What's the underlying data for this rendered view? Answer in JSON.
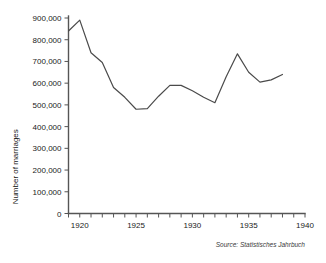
{
  "figure": {
    "background_color": "#ffffff",
    "axis_color": "#555555",
    "line_color": "#4a4a4a",
    "source_note": "Source:  Statistisches Jahrbuch"
  },
  "chart_data": {
    "type": "line",
    "title": "",
    "xlabel": "",
    "ylabel": "Number of marriages",
    "xlim": [
      1919,
      1940
    ],
    "ylim": [
      0,
      900000
    ],
    "grid": false,
    "legend": "none",
    "x": [
      1919,
      1920,
      1921,
      1922,
      1923,
      1924,
      1925,
      1926,
      1927,
      1928,
      1929,
      1930,
      1931,
      1932,
      1933,
      1934,
      1935,
      1936,
      1937,
      1938
    ],
    "values": [
      840000,
      890000,
      740000,
      695000,
      580000,
      535000,
      480000,
      483000,
      540000,
      590000,
      590000,
      565000,
      535000,
      510000,
      630000,
      735000,
      650000,
      605000,
      615000,
      640000
    ],
    "series": [
      {
        "name": "Number of marriages",
        "values": [
          840000,
          890000,
          740000,
          695000,
          580000,
          535000,
          480000,
          483000,
          540000,
          590000,
          590000,
          565000,
          535000,
          510000,
          630000,
          735000,
          650000,
          605000,
          615000,
          640000
        ]
      }
    ],
    "y_ticks": [
      0,
      100000,
      200000,
      300000,
      400000,
      500000,
      600000,
      700000,
      800000,
      900000
    ],
    "y_tick_labels": [
      "0",
      "100,000",
      "200,000",
      "300,000",
      "400,000",
      "500,000",
      "600,000",
      "700,000",
      "800,000",
      "900,000"
    ],
    "x_ticks": [
      1919,
      1920,
      1921,
      1922,
      1923,
      1924,
      1925,
      1926,
      1927,
      1928,
      1929,
      1930,
      1931,
      1932,
      1933,
      1934,
      1935,
      1936,
      1937,
      1938,
      1939,
      1940
    ],
    "x_tick_labels": [
      "",
      "1920",
      "",
      "",
      "",
      "",
      "1925",
      "",
      "",
      "",
      "",
      "1930",
      "",
      "",
      "",
      "",
      "1935",
      "",
      "",
      "",
      "",
      "1940"
    ]
  }
}
